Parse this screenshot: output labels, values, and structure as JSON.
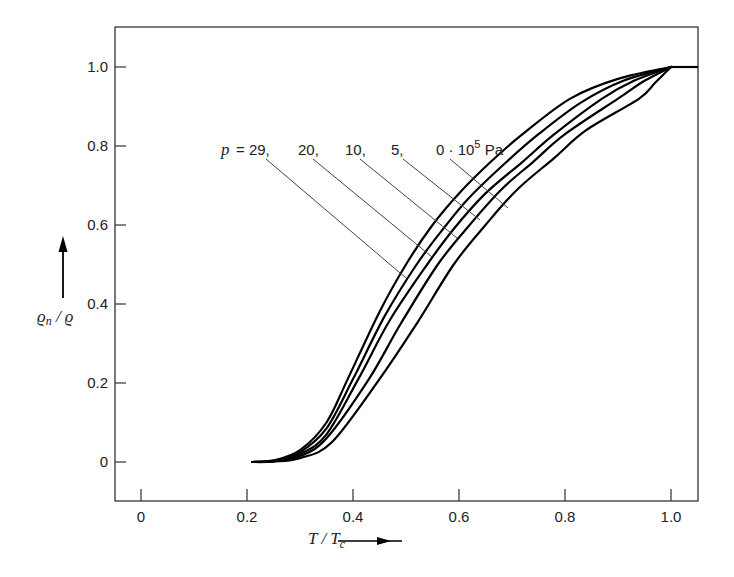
{
  "chart_data": {
    "type": "line",
    "title": "",
    "xlabel": "T / Tc",
    "ylabel": "ρn / ρ",
    "xlim": [
      -0.05,
      1.05
    ],
    "ylim": [
      -0.1,
      1.1
    ],
    "grid": false,
    "x_ticks": [
      "0",
      "0.2",
      "0.4",
      "0.6",
      "0.8",
      "1.0"
    ],
    "y_ticks": [
      "0",
      "0.2",
      "0.4",
      "0.6",
      "0.8",
      "1.0"
    ],
    "legend_position": "inline labels with leader lines, upper center",
    "annotation": "p = 29, 20, 10, 5, 0·10^5 Pa",
    "series": [
      {
        "name": "p = 29·10^5 Pa",
        "label": "p = 29,",
        "x": [
          0.21,
          0.25,
          0.3,
          0.35,
          0.39,
          0.45,
          0.5,
          0.55,
          0.6,
          0.66,
          0.72,
          0.81,
          0.9,
          1.0,
          1.05
        ],
        "y": [
          0.0,
          0.004,
          0.03,
          0.1,
          0.21,
          0.38,
          0.5,
          0.6,
          0.68,
          0.76,
          0.83,
          0.92,
          0.97,
          1.0,
          1.0
        ]
      },
      {
        "name": "p = 20·10^5 Pa",
        "label": "20,",
        "x": [
          0.21,
          0.25,
          0.3,
          0.35,
          0.4,
          0.46,
          0.52,
          0.57,
          0.62,
          0.69,
          0.75,
          0.83,
          0.91,
          1.0,
          1.05
        ],
        "y": [
          0.0,
          0.003,
          0.025,
          0.085,
          0.21,
          0.37,
          0.5,
          0.59,
          0.67,
          0.76,
          0.83,
          0.91,
          0.965,
          1.0,
          1.0
        ]
      },
      {
        "name": "p = 10·10^5 Pa",
        "label": "10,",
        "x": [
          0.21,
          0.25,
          0.3,
          0.35,
          0.41,
          0.47,
          0.54,
          0.59,
          0.65,
          0.72,
          0.78,
          0.87,
          0.93,
          1.0,
          1.05
        ],
        "y": [
          0.0,
          0.002,
          0.02,
          0.07,
          0.21,
          0.36,
          0.5,
          0.59,
          0.68,
          0.76,
          0.83,
          0.92,
          0.965,
          1.0,
          1.0
        ]
      },
      {
        "name": "p = 5·10^5 Pa",
        "label": "5,",
        "x": [
          0.21,
          0.25,
          0.3,
          0.35,
          0.43,
          0.49,
          0.56,
          0.62,
          0.68,
          0.74,
          0.8,
          0.9,
          0.95,
          1.0,
          1.05
        ],
        "y": [
          0.0,
          0.002,
          0.015,
          0.06,
          0.21,
          0.35,
          0.5,
          0.6,
          0.69,
          0.76,
          0.83,
          0.92,
          0.965,
          1.0,
          1.0
        ]
      },
      {
        "name": "p = 0·10^5 Pa",
        "label": "0·10^5 Pa",
        "x": [
          0.21,
          0.25,
          0.3,
          0.36,
          0.45,
          0.52,
          0.59,
          0.65,
          0.71,
          0.78,
          0.84,
          0.94,
          0.97,
          1.0,
          1.05
        ],
        "y": [
          0.0,
          0.001,
          0.01,
          0.05,
          0.21,
          0.35,
          0.5,
          0.6,
          0.69,
          0.77,
          0.84,
          0.92,
          0.96,
          1.0,
          1.0
        ]
      }
    ]
  },
  "labels": {
    "p_prefix": "p",
    "equals": "= 29,",
    "l20": "20,",
    "l10": "10,",
    "l5": "5,",
    "l0": "0 · 10",
    "l0_exp": "5",
    "l0_unit": " Pa"
  },
  "axis": {
    "x_title_main": "T / T",
    "x_title_sub": "c",
    "y_title_main": "ϱ",
    "y_title_sub": "n",
    "y_title_rest": " / ϱ"
  },
  "colors": {
    "curve": "#000000",
    "frame": "#333333",
    "leader": "#444444"
  }
}
